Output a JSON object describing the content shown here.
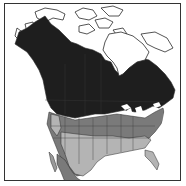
{
  "map": {
    "subject": "North America range map",
    "colors": {
      "background": "#ffffff",
      "frame": "#333333",
      "range_dark": "#1e1e1e",
      "range_mid": "#7a7a7a",
      "range_light": "#b4b4b4",
      "outline": "#2a2a2a",
      "water": "#ffffff"
    },
    "legend": []
  }
}
